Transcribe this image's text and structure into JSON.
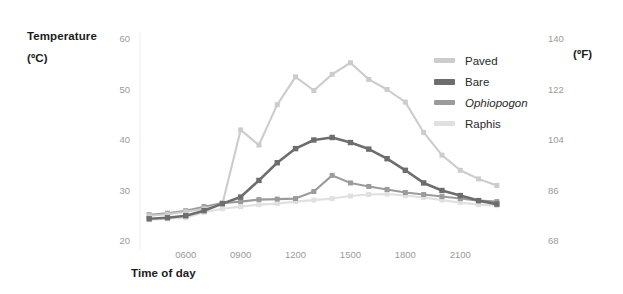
{
  "axes": {
    "y_left_title_line1": "Temperature",
    "y_left_title_line2": "(ºC)",
    "y_right_title": "(ºF)",
    "x_title": "Time of day"
  },
  "chart_data": {
    "type": "line",
    "title": "",
    "xlabel": "Time of day",
    "ylabel": "Temperature (ºC)",
    "y2label": "(ºF)",
    "xlim": [
      3.5,
      23.5
    ],
    "ylim": [
      20,
      60
    ],
    "y2lim": [
      68,
      140
    ],
    "grid": false,
    "legend_position": "top-right",
    "xticks": [
      "0600",
      "0900",
      "1200",
      "1500",
      "1800",
      "2100"
    ],
    "xtick_values": [
      6,
      9,
      12,
      15,
      18,
      21
    ],
    "yticks": [
      20,
      30,
      40,
      50,
      60
    ],
    "y2ticks": [
      68,
      86,
      104,
      122,
      140
    ],
    "x": [
      4.0,
      5.0,
      6.0,
      7.0,
      8.0,
      9.0,
      10.0,
      11.0,
      12.0,
      13.0,
      14.0,
      15.0,
      16.0,
      17.0,
      18.0,
      19.0,
      20.0,
      21.0,
      22.0,
      23.0
    ],
    "series": [
      {
        "name": "Paved",
        "color": "#cccccc",
        "italic": false,
        "values": [
          25.0,
          25.3,
          25.8,
          26.4,
          27.3,
          42.0,
          39.0,
          47.0,
          52.5,
          49.8,
          53.0,
          55.3,
          52.0,
          50.0,
          47.5,
          41.5,
          37.0,
          34.0,
          32.3,
          31.0
        ]
      },
      {
        "name": "Bare",
        "color": "#6d6d6d",
        "italic": false,
        "values": [
          24.4,
          24.6,
          25.0,
          26.0,
          27.4,
          28.7,
          32.0,
          35.5,
          38.3,
          40.0,
          40.5,
          39.5,
          38.2,
          36.3,
          34.0,
          31.5,
          30.0,
          29.0,
          28.0,
          27.3
        ]
      },
      {
        "name": "Ophiopogon",
        "color": "#9b9b9b",
        "italic": true,
        "values": [
          25.2,
          25.5,
          26.0,
          26.8,
          27.5,
          27.8,
          28.2,
          28.3,
          28.4,
          29.8,
          33.0,
          31.5,
          30.8,
          30.2,
          29.6,
          29.2,
          28.8,
          28.4,
          28.0,
          27.8
        ]
      },
      {
        "name": "Raphis",
        "color": "#e0e0e0",
        "italic": true,
        "values": [
          24.2,
          24.4,
          24.6,
          25.7,
          26.4,
          26.8,
          27.2,
          27.4,
          27.8,
          28.1,
          28.4,
          28.9,
          29.2,
          29.3,
          29.0,
          28.6,
          28.1,
          27.6,
          27.2,
          27.0
        ]
      }
    ]
  },
  "legend": {
    "items": [
      {
        "label": "Paved",
        "color": "#cccccc",
        "italic": false
      },
      {
        "label": "Bare",
        "color": "#6d6d6d",
        "italic": false
      },
      {
        "label": "Ophiopogon",
        "color": "#9b9b9b",
        "italic": true
      },
      {
        "label": "Raphis",
        "color": "#e0e0e0",
        "italic": false
      }
    ]
  }
}
